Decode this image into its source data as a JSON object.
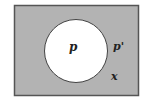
{
  "diagram": {
    "type": "venn",
    "universe": {
      "label": "x",
      "fill": "#b3b3b3",
      "stroke": "#555555"
    },
    "set": {
      "label": "p",
      "fill": "#ffffff",
      "stroke": "#444444"
    },
    "complement": {
      "label": "p'"
    }
  }
}
